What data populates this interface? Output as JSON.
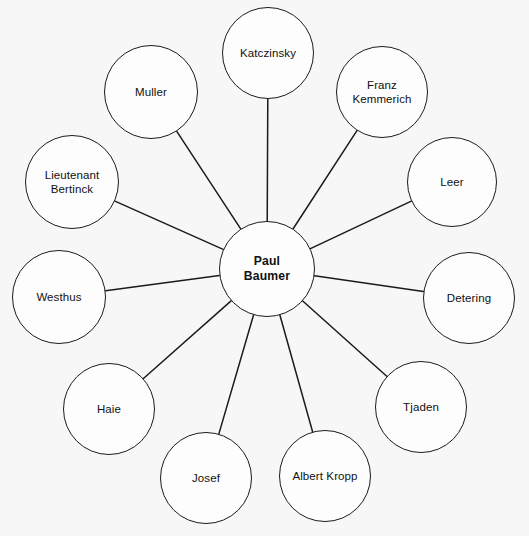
{
  "diagram": {
    "type": "radial-character-map",
    "background_color": "#f7f7f7",
    "stroke_color": "#1b1b1b",
    "text_color": "#111111",
    "center": {
      "label": "Paul\nBaumer",
      "name": "Paul Baumer",
      "cx": 267,
      "cy": 269,
      "r": 48
    },
    "satellites": [
      {
        "label": "Katczinsky",
        "cx": 268,
        "cy": 53,
        "r": 46
      },
      {
        "label": "Franz\nKemmerich",
        "cx": 382,
        "cy": 92,
        "r": 46
      },
      {
        "label": "Leer",
        "cx": 452,
        "cy": 182,
        "r": 45
      },
      {
        "label": "Detering",
        "cx": 469,
        "cy": 298,
        "r": 46
      },
      {
        "label": "Tjaden",
        "cx": 421,
        "cy": 407,
        "r": 46
      },
      {
        "label": "Albert Kropp",
        "cx": 325,
        "cy": 476,
        "r": 46
      },
      {
        "label": "Josef",
        "cx": 206,
        "cy": 478,
        "r": 46
      },
      {
        "label": "Haie",
        "cx": 109,
        "cy": 409,
        "r": 46
      },
      {
        "label": "Westhus",
        "cx": 59,
        "cy": 297,
        "r": 47
      },
      {
        "label": "Lieutenant\nBertinck",
        "cx": 72,
        "cy": 182,
        "r": 47
      },
      {
        "label": "Muller",
        "cx": 151,
        "cy": 92,
        "r": 47
      },
      {
        "label": "Franz Kemmerich Link",
        "cx": 382,
        "cy": 92,
        "r": 46,
        "hidden": true
      }
    ]
  }
}
